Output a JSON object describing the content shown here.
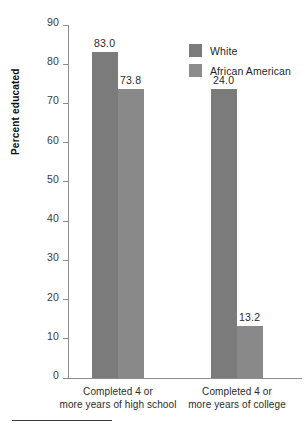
{
  "chart_data": {
    "type": "bar",
    "title": "",
    "xlabel": "",
    "ylabel": "Percent educated",
    "ylim": [
      0,
      90
    ],
    "ytick_step": 10,
    "yticks": [
      90,
      80,
      70,
      60,
      50,
      40,
      30,
      20,
      10,
      0
    ],
    "grid": false,
    "legend_position": "top-right",
    "categories": [
      "Completed 4 or\nmore years of high school",
      "Completed 4 or\nmore years of college"
    ],
    "category_lines": [
      [
        "Completed 4 or",
        "more years of high school"
      ],
      [
        "Completed 4 or",
        "more years of college"
      ]
    ],
    "series": [
      {
        "name": "White",
        "color": "#7b7b7b",
        "values": [
          83.0,
          73.8
        ],
        "value_labels": [
          "83.0",
          "24.0"
        ]
      },
      {
        "name": "African American",
        "color": "#8c8c8c",
        "values": [
          73.8,
          13.2
        ],
        "value_labels": [
          "73.8",
          "13.2"
        ]
      }
    ],
    "data_labels": {
      "high_school": {
        "white": "83.0",
        "african_american": "73.8"
      },
      "college": {
        "white": "24.0",
        "african_american": "13.2"
      }
    }
  },
  "legend": {
    "items": [
      {
        "label": "White",
        "color": "#7b7b7b"
      },
      {
        "label": "African American",
        "color": "#8c8c8c"
      }
    ]
  },
  "axis": {
    "y_title": "Percent educated",
    "y_tick_labels": [
      "90",
      "80",
      "70",
      "60",
      "50",
      "40",
      "30",
      "20",
      "10",
      "0"
    ]
  },
  "colors": {
    "white_series": "#7b7b7b",
    "african_american_series": "#8c8c8c",
    "axis": "#8c8c8c",
    "text": "#2b2b2b",
    "background": "#ffffff"
  }
}
